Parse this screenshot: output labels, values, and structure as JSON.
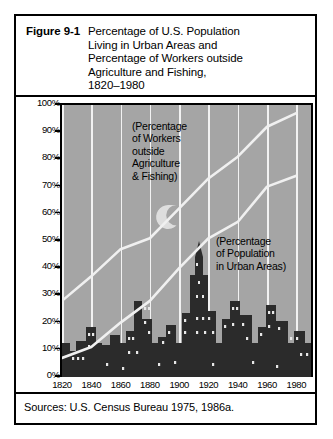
{
  "figure": {
    "label": "Figure 9-1",
    "title": "Percentage of U.S. Population\nLiving in Urban Areas and\nPercentage of Workers outside\nAgriculture and Fishing,\n1820–1980",
    "source": "Sources: U.S. Census Bureau 1975, 1986a."
  },
  "annotations": {
    "workers": "(Percentage\nof Workers\noutside\nAgriculture\n& Fishing)",
    "urban": "(Percentage\nof Population\nin Urban Areas)"
  },
  "colors": {
    "plot_background": "#a5a5a5",
    "gridline": "#f2f2f2",
    "curve": "#f0f0f0",
    "skyline": "#2b2b2b",
    "axis": "#000000",
    "card_background": "#ffffff"
  },
  "chart_data": {
    "type": "line",
    "xlabel": "",
    "ylabel": "",
    "xlim": [
      1820,
      1990
    ],
    "ylim": [
      0,
      100
    ],
    "grid": true,
    "legend": "annotations-inline",
    "x_ticks": [
      1820,
      1840,
      1860,
      1880,
      1900,
      1920,
      1940,
      1960,
      1980
    ],
    "y_ticks": [
      0,
      10,
      20,
      30,
      40,
      50,
      60,
      70,
      80,
      90,
      100
    ],
    "y_tick_labels": [
      "0%",
      "10%",
      "20%",
      "30%",
      "40%",
      "50%",
      "60%",
      "70%",
      "80%",
      "90%",
      "100%"
    ],
    "x": [
      1820,
      1840,
      1860,
      1880,
      1900,
      1920,
      1940,
      1960,
      1980
    ],
    "series": [
      {
        "name": "(Percentage of Workers outside Agriculture & Fishing)",
        "values": [
          28,
          37,
          47,
          51,
          62,
          73,
          81,
          92,
          97
        ]
      },
      {
        "name": "(Percentage of Population in Urban Areas)",
        "values": [
          7,
          11,
          20,
          28,
          40,
          51,
          57,
          70,
          74
        ]
      }
    ],
    "background_illustration": "city-skyline-with-crescent-moon"
  }
}
